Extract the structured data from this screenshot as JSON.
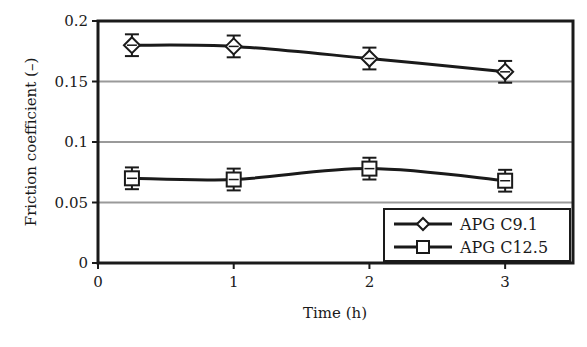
{
  "chart_data": {
    "type": "line",
    "title": "",
    "xlabel": "Time (h)",
    "ylabel": "Friction coefficient (–)",
    "xlim": [
      0,
      3.5
    ],
    "ylim": [
      0,
      0.2
    ],
    "x_ticks": [
      0,
      1,
      2,
      3
    ],
    "x_tick_labels": [
      "0",
      "1",
      "2",
      "3"
    ],
    "y_ticks": [
      0,
      0.05,
      0.1,
      0.15,
      0.2
    ],
    "y_tick_labels": [
      "0",
      "0.05",
      "0.1",
      "0.15",
      "0.2"
    ],
    "grid": "horizontal",
    "legend_position": "bottom-right",
    "series": [
      {
        "name": "APG C9.1",
        "marker": "diamond",
        "x": [
          0.25,
          1,
          2,
          3
        ],
        "y": [
          0.18,
          0.179,
          0.169,
          0.158
        ],
        "error": [
          0.009,
          0.009,
          0.009,
          0.009
        ]
      },
      {
        "name": "APG C12.5",
        "marker": "square",
        "x": [
          0.25,
          1,
          2,
          3
        ],
        "y": [
          0.07,
          0.069,
          0.078,
          0.068
        ],
        "error": [
          0.009,
          0.009,
          0.009,
          0.009
        ]
      }
    ]
  },
  "colors": {
    "line": "#1a1a1a",
    "grid": "#9a9a9a",
    "background": "#ffffff"
  }
}
